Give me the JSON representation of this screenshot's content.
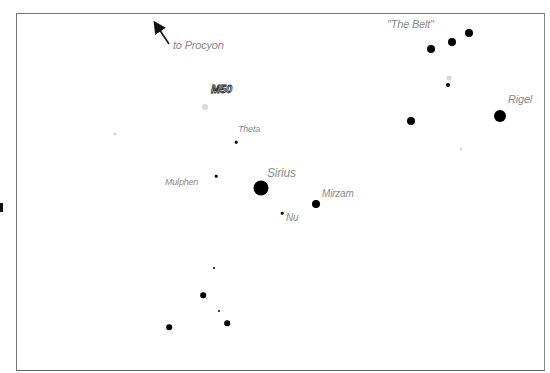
{
  "chart": {
    "type": "star-chart",
    "frame": {
      "x": 16,
      "y": 13,
      "width": 529,
      "height": 358
    },
    "arrow": {
      "label": "to Procyon",
      "from": [
        169,
        44
      ],
      "to": [
        155,
        23
      ]
    },
    "labels": [
      {
        "id": "belt",
        "text": "\"The Belt\"",
        "x": 387,
        "y": 23,
        "size": 11
      },
      {
        "id": "to-procyon",
        "text": "to Procyon",
        "x": 173,
        "y": 44,
        "size": 11
      },
      {
        "id": "m50",
        "text": "M50",
        "x": 211,
        "y": 88,
        "size": 11,
        "outline": true
      },
      {
        "id": "rigel",
        "text": "Rigel",
        "x": 508,
        "y": 98,
        "size": 11
      },
      {
        "id": "theta",
        "text": "Theta",
        "x": 238,
        "y": 128,
        "size": 9
      },
      {
        "id": "sirius",
        "text": "Sirius",
        "x": 267,
        "y": 172,
        "size": 12
      },
      {
        "id": "mulphen",
        "text": "Mulphen",
        "x": 165,
        "y": 181,
        "size": 9
      },
      {
        "id": "mirzam",
        "text": "Mirzam",
        "x": 322,
        "y": 193,
        "size": 10
      },
      {
        "id": "nu",
        "text": "Nu",
        "x": 286,
        "y": 217,
        "size": 10
      }
    ],
    "stars": [
      {
        "name": "belt-1",
        "x": 431,
        "y": 49,
        "r": 4
      },
      {
        "name": "belt-2",
        "x": 452,
        "y": 42,
        "r": 4
      },
      {
        "name": "belt-3",
        "x": 469,
        "y": 33,
        "r": 4
      },
      {
        "name": "faint-near-belt",
        "x": 449,
        "y": 78,
        "r": 2.5,
        "faint": true
      },
      {
        "name": "small-below-belt",
        "x": 448,
        "y": 85,
        "r": 2
      },
      {
        "name": "rigel",
        "x": 500,
        "y": 116,
        "r": 6
      },
      {
        "name": "mid-right",
        "x": 411,
        "y": 121,
        "r": 4
      },
      {
        "name": "m50",
        "x": 205,
        "y": 107,
        "r": 3,
        "faint": true
      },
      {
        "name": "faint-left",
        "x": 115,
        "y": 134,
        "r": 1.5,
        "faint": true
      },
      {
        "name": "faint-right",
        "x": 461,
        "y": 149,
        "r": 1.5,
        "faint": true
      },
      {
        "name": "theta",
        "x": 236,
        "y": 142,
        "r": 1.3
      },
      {
        "name": "mulphen",
        "x": 216,
        "y": 176,
        "r": 1.3
      },
      {
        "name": "sirius",
        "x": 261,
        "y": 188,
        "r": 7.5
      },
      {
        "name": "mirzam",
        "x": 316,
        "y": 204,
        "r": 4
      },
      {
        "name": "nu",
        "x": 282,
        "y": 213,
        "r": 1.3
      },
      {
        "name": "lower-1",
        "x": 214,
        "y": 268,
        "r": 1
      },
      {
        "name": "lower-2",
        "x": 203,
        "y": 295,
        "r": 2.8
      },
      {
        "name": "lower-3",
        "x": 219,
        "y": 311,
        "r": 1
      },
      {
        "name": "lower-4",
        "x": 227,
        "y": 323,
        "r": 2.8
      },
      {
        "name": "lower-5",
        "x": 169,
        "y": 327,
        "r": 2.8
      }
    ]
  }
}
